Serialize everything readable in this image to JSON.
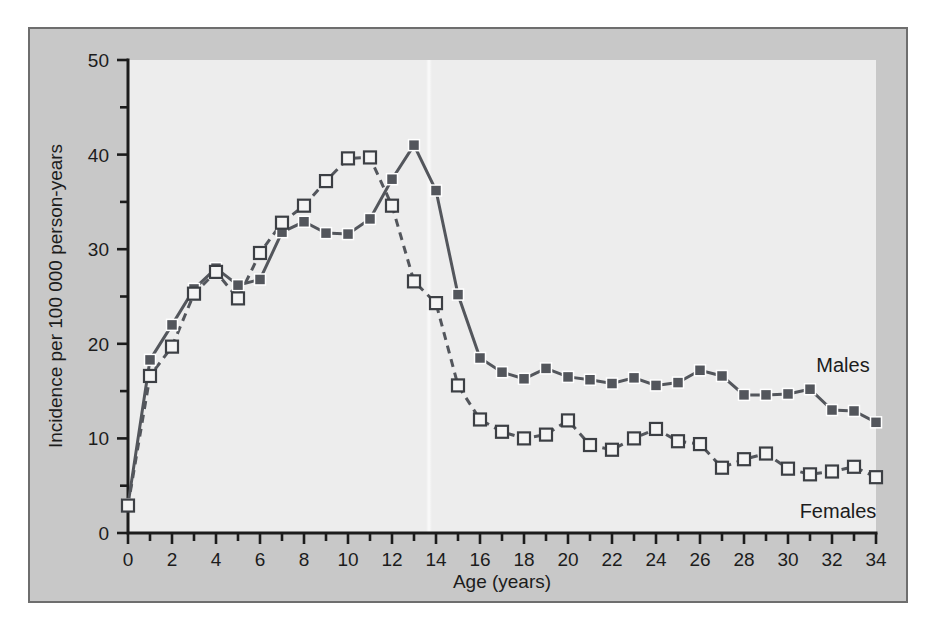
{
  "chart_data": {
    "type": "line",
    "title": "",
    "xlabel": "Age (years)",
    "ylabel": "Incidence per 100 000 person-years",
    "xlim": [
      0,
      34
    ],
    "ylim": [
      0,
      50
    ],
    "xticks": [
      0,
      1,
      2,
      3,
      4,
      5,
      6,
      7,
      8,
      9,
      10,
      11,
      12,
      13,
      14,
      15,
      16,
      17,
      18,
      19,
      20,
      21,
      22,
      23,
      24,
      25,
      26,
      27,
      28,
      29,
      30,
      31,
      32,
      33,
      34
    ],
    "xticklabels": [
      "0",
      "",
      "2",
      "",
      "4",
      "",
      "6",
      "",
      "8",
      "",
      "10",
      "",
      "12",
      "",
      "14",
      "",
      "16",
      "",
      "18",
      "",
      "20",
      "",
      "22",
      "",
      "24",
      "",
      "26",
      "",
      "28",
      "",
      "30",
      "",
      "32",
      "",
      "34"
    ],
    "yticks": [
      0,
      5,
      10,
      15,
      20,
      25,
      30,
      35,
      40,
      45,
      50
    ],
    "yticklabels": [
      "0",
      "",
      "10",
      "",
      "20",
      "",
      "30",
      "",
      "40",
      "",
      "50"
    ],
    "grid": false,
    "legend_position": "inline-annotations",
    "x": [
      0,
      1,
      2,
      3,
      4,
      5,
      6,
      7,
      8,
      9,
      10,
      11,
      12,
      13,
      14,
      15,
      16,
      17,
      18,
      19,
      20,
      21,
      22,
      23,
      24,
      25,
      26,
      27,
      28,
      29,
      30,
      31,
      32,
      33,
      34
    ],
    "series": [
      {
        "name": "Males",
        "marker": "filled-square",
        "linestyle": "solid",
        "color": "#53565c",
        "label_text": "Males",
        "values": [
          3.0,
          18.3,
          22.0,
          25.8,
          28.0,
          26.2,
          26.8,
          31.8,
          32.9,
          31.7,
          31.6,
          33.2,
          37.4,
          41.0,
          36.2,
          25.2,
          18.5,
          17.0,
          16.3,
          17.4,
          16.5,
          16.2,
          15.8,
          16.4,
          15.6,
          15.9,
          17.2,
          16.6,
          14.6,
          14.6,
          14.7,
          15.2,
          13.0,
          12.9,
          11.7
        ]
      },
      {
        "name": "Females",
        "marker": "open-square",
        "linestyle": "dashed",
        "color": "#53565c",
        "label_text": "Females",
        "values": [
          2.9,
          16.6,
          19.7,
          25.3,
          27.6,
          24.8,
          29.6,
          32.8,
          34.6,
          37.2,
          39.6,
          39.7,
          34.6,
          26.6,
          24.3,
          15.6,
          12.0,
          10.7,
          10.0,
          10.4,
          11.9,
          9.3,
          8.8,
          10.0,
          11.0,
          9.7,
          9.4,
          6.9,
          7.8,
          8.4,
          6.8,
          6.2,
          6.5,
          7.0,
          5.9
        ]
      }
    ]
  },
  "annotations": {
    "males_label": "Males",
    "females_label": "Females"
  },
  "colors": {
    "figure_background": "#ffffff",
    "plate_background": "#c8c8c8",
    "plate_border": "#6e6e6e",
    "panel_background": "#ededed",
    "axis": "#1c1c1c",
    "series": "#53565c",
    "open_marker_fill": "#f4f4f4"
  }
}
